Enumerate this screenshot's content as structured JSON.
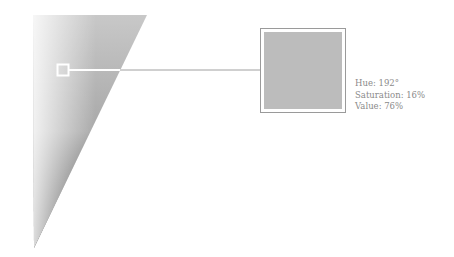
{
  "sample": {
    "hue": 192,
    "saturation": 16,
    "value": 76,
    "swatch_color": "#bcbcbc"
  },
  "info": {
    "hue_text": "Hue: 192°",
    "saturation_text": "Saturation: 16%",
    "value_text": "Value: 76%"
  },
  "colors": {
    "gradient_light": "#ffffff",
    "gradient_mid": "#b4b4b4",
    "gradient_dark": "#1e1e1e",
    "frame": "#ffffff",
    "frame_outline": "#9a9a9a",
    "connector": "#a0a0a0",
    "text": "#8a8a8a"
  }
}
